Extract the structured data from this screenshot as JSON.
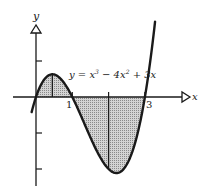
{
  "diagram": {
    "type": "function-graph",
    "function_label": "y = x³ − 4x² + 3x",
    "function_parts": {
      "lhs": "y",
      "eq": " = ",
      "t1": "x",
      "t1_exp": "3",
      "t2": " − 4x",
      "t2_exp": "2",
      "t3": " + 3x"
    },
    "axes": {
      "x_label": "x",
      "y_label": "y",
      "x_tick_labels": [
        {
          "value": 1,
          "text": "1"
        },
        {
          "value": 3,
          "text": "3"
        }
      ],
      "x_ticks": [
        1,
        2,
        3
      ],
      "y_ticks": [
        1,
        -1,
        -2
      ]
    },
    "shaded_regions": [
      {
        "from": 0,
        "to": 1,
        "sign": "positive"
      },
      {
        "from": 1,
        "to": 3,
        "sign": "negative"
      }
    ],
    "vertical_segments": [
      0.45,
      2
    ],
    "colors": {
      "stroke": "#1a1a1a",
      "fill": "#b8b8b8",
      "background": "#ffffff"
    }
  }
}
